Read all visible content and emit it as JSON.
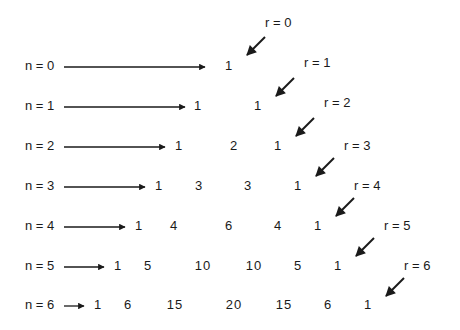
{
  "diagram": {
    "rows": [
      {
        "label": "n = 0",
        "values": [
          "1"
        ]
      },
      {
        "label": "n = 1",
        "values": [
          "1",
          "1"
        ]
      },
      {
        "label": "n = 2",
        "values": [
          "1",
          "2",
          "1"
        ]
      },
      {
        "label": "n = 3",
        "values": [
          "1",
          "3",
          "3",
          "1"
        ]
      },
      {
        "label": "n = 4",
        "values": [
          "1",
          "4",
          "6",
          "4",
          "1"
        ]
      },
      {
        "label": "n = 5",
        "values": [
          "1",
          "5",
          "10",
          "10",
          "5",
          "1"
        ]
      },
      {
        "label": "n = 6",
        "values": [
          "1",
          "6",
          "15",
          "20",
          "15",
          "6",
          "1"
        ]
      }
    ],
    "diagonals": [
      {
        "label": "r = 0"
      },
      {
        "label": "r = 1"
      },
      {
        "label": "r = 2"
      },
      {
        "label": "r = 3"
      },
      {
        "label": "r = 4"
      },
      {
        "label": "r = 5"
      },
      {
        "label": "r = 6"
      }
    ],
    "colors": {
      "ink": "#1a1a1a",
      "background": "#ffffff"
    }
  }
}
